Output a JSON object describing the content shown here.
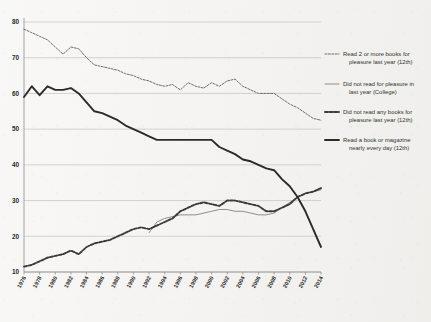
{
  "chart_data": {
    "type": "line",
    "title": "",
    "xlabel": "",
    "ylabel": "",
    "xlim": [
      1976,
      2014
    ],
    "ylim": [
      10,
      80
    ],
    "grid": true,
    "legend_position": "right",
    "x": [
      1976,
      1977,
      1978,
      1979,
      1980,
      1981,
      1982,
      1983,
      1984,
      1985,
      1986,
      1987,
      1988,
      1989,
      1990,
      1991,
      1992,
      1993,
      1994,
      1995,
      1996,
      1997,
      1998,
      1999,
      2000,
      2001,
      2002,
      2003,
      2004,
      2005,
      2006,
      2007,
      2008,
      2009,
      2010,
      2011,
      2012,
      2013,
      2014
    ],
    "xticks": [
      "1976",
      "1978",
      "1980",
      "1982",
      "1984",
      "1986",
      "1988",
      "1990",
      "1992",
      "1994",
      "1996",
      "1998",
      "2000",
      "2002",
      "2004",
      "2006",
      "2008",
      "2010",
      "2012",
      "2014"
    ],
    "yticks": [
      10,
      20,
      30,
      40,
      50,
      60,
      70,
      80
    ],
    "series": [
      {
        "name": "Read 2 or more books for pleasure last year (12th)",
        "style": "dashed",
        "weight": "thin",
        "color": "#6e6e6c",
        "values": [
          78,
          77,
          76,
          75,
          73,
          71,
          73,
          72.5,
          70,
          68,
          67.5,
          67,
          66.5,
          65.5,
          65,
          64,
          63.5,
          62.5,
          62,
          62.5,
          61,
          63,
          62,
          61.5,
          63,
          62,
          63.5,
          64,
          62,
          61,
          60,
          60,
          60,
          58.5,
          57,
          56,
          54.5,
          53,
          52.5
        ]
      },
      {
        "name": "Did not read for pleasure in last year (College)",
        "style": "solid",
        "weight": "thin",
        "color": "#8d8d8a",
        "values": [
          null,
          null,
          null,
          null,
          null,
          null,
          null,
          null,
          null,
          null,
          null,
          null,
          null,
          null,
          null,
          null,
          21,
          24,
          25,
          25.5,
          26,
          26,
          26,
          26.5,
          27,
          27.5,
          27.5,
          27,
          27,
          26.5,
          26,
          26,
          26.5,
          28,
          29.5,
          31,
          32,
          32.5,
          33
        ]
      },
      {
        "name": "Did not read any books for pleasure last year (12th)",
        "style": "dashed",
        "weight": "bold",
        "color": "#3a3a38",
        "values": [
          11.5,
          12,
          13,
          14,
          14.5,
          15,
          16,
          15,
          17,
          18,
          18.5,
          19,
          20,
          21,
          22,
          22.5,
          22,
          23,
          24,
          25,
          27,
          28,
          29,
          29.5,
          29,
          28.5,
          30,
          30,
          29.5,
          29,
          28.5,
          27,
          27,
          28,
          29,
          31,
          32,
          32.5,
          33.5
        ]
      },
      {
        "name": "Read a book or magazine nearly every day (12th)",
        "style": "solid",
        "weight": "bold",
        "color": "#2a2a28",
        "values": [
          59,
          62,
          59.5,
          62,
          61,
          61,
          61.5,
          60,
          57.5,
          55,
          54.5,
          53.5,
          52.5,
          51,
          50,
          49,
          48,
          47,
          47,
          47,
          47,
          47,
          47,
          47,
          47,
          45,
          44,
          43,
          41.5,
          41,
          40,
          39,
          38.5,
          36,
          34,
          31,
          27,
          22,
          17
        ]
      }
    ],
    "legend": [
      {
        "label_line1": "Read 2 or more books for",
        "label_line2": "pleasure last year (12th)"
      },
      {
        "label_line1": "Did not read for pleasure in",
        "label_line2": "last year (College)"
      },
      {
        "label_line1": "Did not read any books for",
        "label_line2": "pleasure last year (12th)"
      },
      {
        "label_line1": "Read a book or magazine",
        "label_line2": "nearly every day (12th)"
      }
    ]
  }
}
